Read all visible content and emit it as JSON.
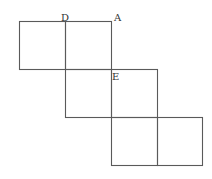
{
  "diagram": {
    "cell_size": 46,
    "stroke_color": "#5a5a5a",
    "background": "#ffffff",
    "cells": [
      {
        "row": 0,
        "col": 0
      },
      {
        "row": 0,
        "col": 1
      },
      {
        "row": 1,
        "col": 1
      },
      {
        "row": 1,
        "col": 2
      },
      {
        "row": 2,
        "col": 2
      },
      {
        "row": 2,
        "col": 3
      }
    ],
    "labels": [
      {
        "text": "D",
        "x": 61,
        "y": 21
      },
      {
        "text": "A",
        "x": 114,
        "y": 21
      },
      {
        "text": "E",
        "x": 114,
        "y": 78
      }
    ]
  }
}
